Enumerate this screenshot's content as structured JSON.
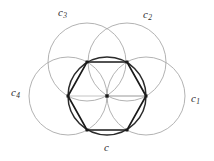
{
  "figure": {
    "width": 214,
    "height": 161,
    "background_color": "#ffffff",
    "outer_circle_color": "#a9a9a9",
    "inner_circle_color": "#2b2b2b",
    "hexagon_color": "#1a1a1a",
    "label_color": "#2b2b2b",
    "labels": {
      "c3": {
        "base": "c",
        "sub": "3",
        "x": 58,
        "y": 7
      },
      "c2": {
        "base": "c",
        "sub": "2",
        "x": 143,
        "y": 9
      },
      "c4": {
        "base": "c",
        "sub": "4",
        "x": 11,
        "y": 87
      },
      "c1": {
        "base": "c",
        "sub": "1",
        "x": 191,
        "y": 93
      },
      "c": {
        "base": "c",
        "sub": "",
        "x": 104,
        "y": 142
      }
    },
    "geometry": {
      "center": {
        "x": 107,
        "y": 96
      },
      "radius": 39,
      "outer_circles": [
        {
          "name": "c1",
          "cx": 146,
          "cy": 96
        },
        {
          "name": "c2",
          "cx": 127,
          "cy": 62
        },
        {
          "name": "c3",
          "cx": 87,
          "cy": 62
        },
        {
          "name": "c4",
          "cx": 68,
          "cy": 96
        }
      ],
      "hexagon_vertices": [
        {
          "x": 146,
          "y": 96
        },
        {
          "x": 127,
          "y": 62
        },
        {
          "x": 87,
          "y": 62
        },
        {
          "x": 68,
          "y": 96
        },
        {
          "x": 87,
          "y": 130
        },
        {
          "x": 127,
          "y": 130
        }
      ],
      "marked_points": [
        {
          "x": 107,
          "y": 96
        },
        {
          "x": 146,
          "y": 96
        },
        {
          "x": 127,
          "y": 62
        },
        {
          "x": 87,
          "y": 62
        },
        {
          "x": 68,
          "y": 96
        },
        {
          "x": 87,
          "y": 130
        },
        {
          "x": 127,
          "y": 130
        }
      ]
    }
  }
}
